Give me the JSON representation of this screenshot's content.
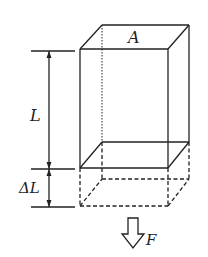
{
  "diagram": {
    "labels": {
      "area": "A",
      "length": "L",
      "elongation": "ΔL",
      "force": "F"
    },
    "colors": {
      "stroke": "#222222",
      "background": "#ffffff"
    }
  }
}
